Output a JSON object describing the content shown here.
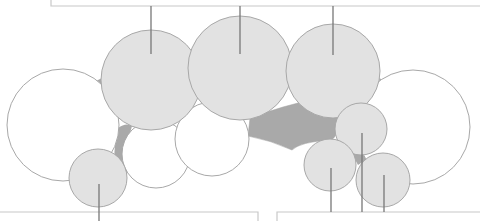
{
  "colors": {
    "background": "#ffffff",
    "gray_circle_fill": "#e2e2e2",
    "white_circle_fill": "#ffffff",
    "circle_stroke": "#a8a8a8",
    "connector_fill": "#a9a9a9",
    "line": "#777777",
    "box_stroke": "#c8c8c8"
  },
  "circles": [
    {
      "id": "left-large-white",
      "cx": 63,
      "cy": 125,
      "r": 56,
      "kind": "white"
    },
    {
      "id": "right-large-white",
      "cx": 413,
      "cy": 127,
      "r": 57,
      "kind": "white"
    },
    {
      "id": "mid-left-white",
      "cx": 156,
      "cy": 154,
      "r": 34,
      "kind": "white"
    },
    {
      "id": "mid-white",
      "cx": 212,
      "cy": 139,
      "r": 37,
      "kind": "white"
    },
    {
      "id": "top-left-gray",
      "cx": 151,
      "cy": 80,
      "r": 50,
      "kind": "gray"
    },
    {
      "id": "top-middle-gray",
      "cx": 240,
      "cy": 68,
      "r": 52,
      "kind": "gray"
    },
    {
      "id": "top-right-gray",
      "cx": 333,
      "cy": 71,
      "r": 47,
      "kind": "gray"
    },
    {
      "id": "bottom-left-small-gray",
      "cx": 98,
      "cy": 178,
      "r": 29,
      "kind": "gray"
    },
    {
      "id": "right-small-gray-1",
      "cx": 361,
      "cy": 129,
      "r": 26,
      "kind": "gray"
    },
    {
      "id": "right-small-gray-2",
      "cx": 330,
      "cy": 165,
      "r": 26,
      "kind": "gray"
    },
    {
      "id": "right-small-gray-3",
      "cx": 383,
      "cy": 180,
      "r": 27,
      "kind": "gray"
    }
  ],
  "top_box": {
    "x": 51,
    "y": 6,
    "width": 440,
    "height": 0
  },
  "bottom_boxes": [
    {
      "id": "bottom-left-box",
      "x1": 0,
      "x2": 258,
      "y": 212
    },
    {
      "id": "bottom-right-box",
      "x1": 277,
      "x2": 480,
      "y": 212
    }
  ],
  "leader_lines": [
    {
      "id": "leader-top-left",
      "x": 151,
      "y1": 6,
      "y2": 54
    },
    {
      "id": "leader-top-middle",
      "x": 240,
      "y1": 6,
      "y2": 54
    },
    {
      "id": "leader-top-right",
      "x": 333,
      "y1": 6,
      "y2": 55
    },
    {
      "id": "leader-bottom-left",
      "x": 99,
      "y1": 184,
      "y2": 221
    },
    {
      "id": "leader-bottom-right-1",
      "x": 331,
      "y1": 168,
      "y2": 212
    },
    {
      "id": "leader-bottom-right-2",
      "x": 362,
      "y1": 133,
      "y2": 212
    },
    {
      "id": "leader-bottom-right-3",
      "x": 384,
      "y1": 175,
      "y2": 212
    }
  ]
}
